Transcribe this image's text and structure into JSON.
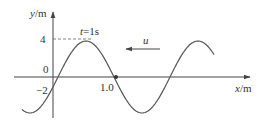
{
  "diagram": {
    "type": "transverse wave graph",
    "y_axis_label_var": "y",
    "y_axis_label_unit": "/m",
    "x_axis_label_var": "x",
    "x_axis_label_unit": "/m",
    "tick_y_top": "4",
    "tick_origin": "0",
    "tick_y_neg": "−2",
    "tick_x": "1.0",
    "time_label_var": "t",
    "time_label_value": "=1s",
    "velocity_label": "u",
    "velocity_direction": "left",
    "colors": {
      "curve": "#555555",
      "axis": "#444444",
      "text": "#333333",
      "background": "#ffffff"
    }
  }
}
